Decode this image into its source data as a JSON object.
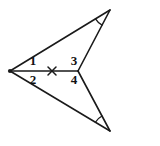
{
  "figure": {
    "background_color": "#ffffff",
    "stroke_color": "#1a1a1a",
    "label_color": "#111111",
    "width": 160,
    "height": 146,
    "vertices": {
      "left": {
        "name": "left-vertex",
        "x": 10,
        "y": 71
      },
      "middle": {
        "name": "middle-vertex",
        "x": 78,
        "y": 71
      },
      "top_right": {
        "name": "top-right-vertex",
        "x": 110,
        "y": 10
      },
      "bottom_right": {
        "name": "bottom-right-vertex",
        "x": 110,
        "y": 131
      }
    },
    "segments": [
      {
        "name": "upper-long-side",
        "from": "left",
        "to": "top_right"
      },
      {
        "name": "lower-long-side",
        "from": "left",
        "to": "bottom_right"
      },
      {
        "name": "shared-horizontal-side",
        "from": "left",
        "to": "middle"
      },
      {
        "name": "upper-right-side",
        "from": "middle",
        "to": "top_right"
      },
      {
        "name": "lower-right-side",
        "from": "middle",
        "to": "bottom_right"
      }
    ],
    "tick_mark": {
      "name": "congruence-tick-mark",
      "glyph": "x",
      "x": 52,
      "y": 71
    },
    "angle_labels": [
      {
        "id": "1",
        "text": "1",
        "x": 33,
        "y": 62,
        "position": "upper-left",
        "belongs_to": "left-vertex"
      },
      {
        "id": "2",
        "text": "2",
        "x": 33,
        "y": 81,
        "position": "lower-left",
        "belongs_to": "left-vertex"
      },
      {
        "id": "3",
        "text": "3",
        "x": 74,
        "y": 62,
        "position": "upper-right",
        "belongs_to": "middle-vertex"
      },
      {
        "id": "4",
        "text": "4",
        "x": 74,
        "y": 81,
        "position": "lower-right",
        "belongs_to": "middle-vertex"
      }
    ],
    "angle_arcs": [
      {
        "name": "top-right-angle-arc",
        "vertex": "top_right",
        "radius": 17
      },
      {
        "name": "bottom-right-angle-arc",
        "vertex": "bottom_right",
        "radius": 17
      }
    ]
  }
}
